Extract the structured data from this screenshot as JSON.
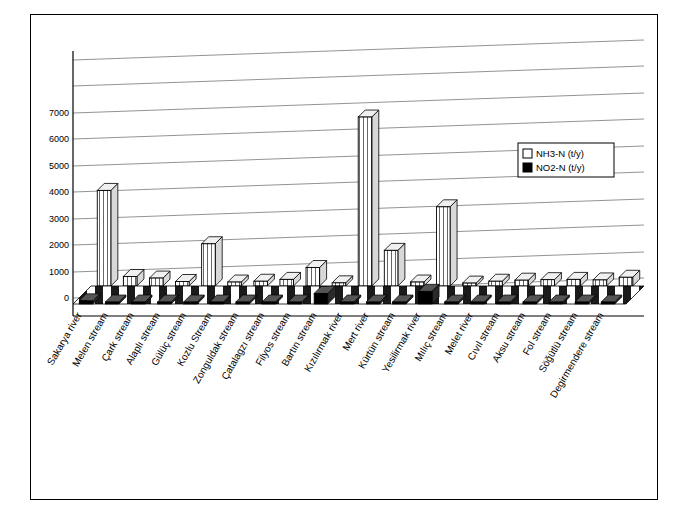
{
  "chart_data": {
    "type": "bar",
    "title": "",
    "xlabel": "",
    "ylabel": "",
    "ylim": [
      0,
      7000
    ],
    "yticks": [
      0,
      1000,
      2000,
      3000,
      4000,
      5000,
      6000,
      7000
    ],
    "grid": true,
    "legend_position": "top-right",
    "three_d": true,
    "categories": [
      "Sakarya river",
      "Melen stream",
      "Çark stream",
      "Alaplı stream",
      "Gülüç stream",
      "Kozlu Stream",
      "Zonguldak stream",
      "Çatalagzı stream",
      "Filyos stream",
      "Bartın stream",
      "Kızılırmak river",
      "Mert river",
      "Kürtün stream",
      "Yesilirmak river",
      "Mılıç stream",
      "Melet river",
      "Cıvıl stream",
      "Aksu stream",
      "Fol stream",
      "Söğütlü stream",
      "Degirmendere stream"
    ],
    "series": [
      {
        "name": "NH3-N (t/y)",
        "color": "#ffffff",
        "values": [
          3620,
          360,
          300,
          170,
          1600,
          150,
          180,
          250,
          700,
          120,
          6400,
          1350,
          150,
          3000,
          110,
          180,
          220,
          240,
          250,
          230,
          330
        ]
      },
      {
        "name": "NO2-N (t/y)",
        "color": "#000000",
        "values": [
          120,
          40,
          30,
          20,
          60,
          20,
          20,
          25,
          35,
          400,
          60,
          35,
          20,
          480,
          15,
          20,
          20,
          25,
          25,
          25,
          30
        ]
      }
    ]
  },
  "legend": {
    "items": [
      {
        "label": "NH3-N (t/y)",
        "swatch": "white"
      },
      {
        "label": "NO2-N (t/y)",
        "swatch": "black"
      }
    ]
  },
  "axis": {
    "y_tick_labels": [
      "0",
      "1000",
      "2000",
      "3000",
      "4000",
      "5000",
      "6000",
      "7000"
    ]
  }
}
